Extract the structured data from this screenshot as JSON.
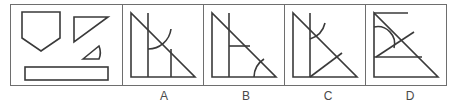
{
  "puzzle": {
    "type": "shape-assembly-multiple-choice",
    "question_panel": {
      "name": "pieces-panel",
      "piece_count": 4,
      "pieces": [
        {
          "id": "piece-pentagon",
          "label": "pentagon",
          "description": "home-plate pentagon pointing downward"
        },
        {
          "id": "piece-right-triangle",
          "label": "right triangle",
          "description": "right triangle with right angle at top-left"
        },
        {
          "id": "piece-arc-sector",
          "label": "arc sector",
          "description": "small triangular piece with curved right edge"
        },
        {
          "id": "piece-rectangle",
          "label": "rectangle",
          "description": "long thin horizontal rectangle"
        }
      ]
    },
    "options": [
      {
        "key": "A",
        "label": "A",
        "name": "option-a",
        "description": "right triangle with tall left rectangle, inner vertical line and concave arc"
      },
      {
        "key": "B",
        "label": "B",
        "name": "option-b",
        "description": "right triangle with left rectangle, horizontal divider and arc at bottom-right corner"
      },
      {
        "key": "C",
        "label": "C",
        "name": "option-c",
        "description": "right triangle with left rectangle, arc near top and diagonal from bottom-left"
      },
      {
        "key": "D",
        "label": "D",
        "name": "option-d",
        "description": "right triangle with large semicircular arc at upper-left, diagonal and horizontal divider"
      }
    ]
  },
  "colors": {
    "stroke": "#3a3a3a",
    "frame": "#6e6e6e",
    "background": "#ffffff",
    "label_text": "#4a4a4a"
  }
}
